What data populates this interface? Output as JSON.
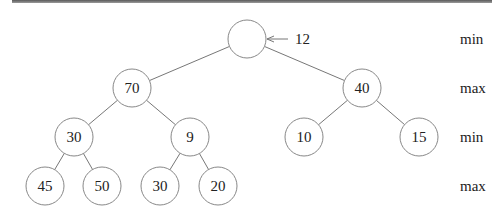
{
  "diagram": {
    "type": "minimax-game-tree",
    "root_annotation": "12",
    "level_labels": [
      "min",
      "max",
      "min",
      "max"
    ],
    "nodes": [
      {
        "id": "root",
        "value": "",
        "level": 0
      },
      {
        "id": "n70",
        "value": "70",
        "level": 1,
        "parent": "root"
      },
      {
        "id": "n40",
        "value": "40",
        "level": 1,
        "parent": "root"
      },
      {
        "id": "n30a",
        "value": "30",
        "level": 2,
        "parent": "n70"
      },
      {
        "id": "n9",
        "value": "9",
        "level": 2,
        "parent": "n70"
      },
      {
        "id": "n10",
        "value": "10",
        "level": 2,
        "parent": "n40"
      },
      {
        "id": "n15",
        "value": "15",
        "level": 2,
        "parent": "n40"
      },
      {
        "id": "n45",
        "value": "45",
        "level": 3,
        "parent": "n30a"
      },
      {
        "id": "n50",
        "value": "50",
        "level": 3,
        "parent": "n30a"
      },
      {
        "id": "n30b",
        "value": "30",
        "level": 3,
        "parent": "n9"
      },
      {
        "id": "n20",
        "value": "20",
        "level": 3,
        "parent": "n9"
      }
    ]
  }
}
